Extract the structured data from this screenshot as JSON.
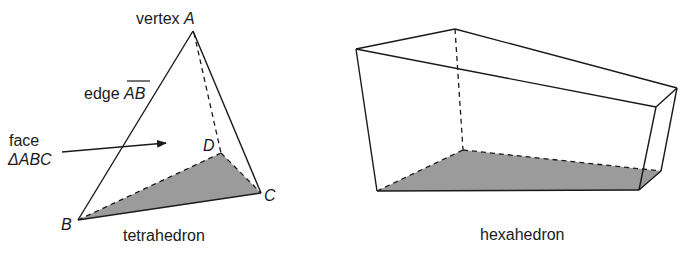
{
  "tetrahedron": {
    "caption": "tetrahedron",
    "vertex_label_prefix": "vertex ",
    "vertices": {
      "A": "A",
      "B": "B",
      "C": "C",
      "D": "D"
    },
    "edge_label_prefix": "edge ",
    "edge_name": "AB",
    "face_label_line1": "face",
    "face_label_line2": "ΔABC"
  },
  "hexahedron": {
    "caption": "hexahedron"
  },
  "colors": {
    "stroke": "#1a1a1a",
    "shaded_face": "#9b9b9b"
  }
}
